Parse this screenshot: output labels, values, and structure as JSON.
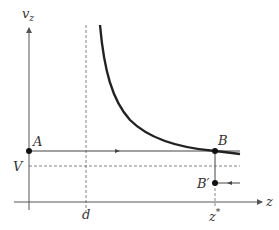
{
  "diagram": {
    "axes": {
      "y_label": "v",
      "y_label_sub": "z",
      "x_label": "z"
    },
    "points": {
      "A": "A",
      "B": "B",
      "B_prime": "B′"
    },
    "ticks": {
      "V": "V",
      "d": "d",
      "z_star": "z",
      "z_star_sup": "*"
    },
    "colors": {
      "axis": "#555555",
      "curve": "#222222",
      "dashed": "#666666",
      "text": "#333333"
    }
  }
}
